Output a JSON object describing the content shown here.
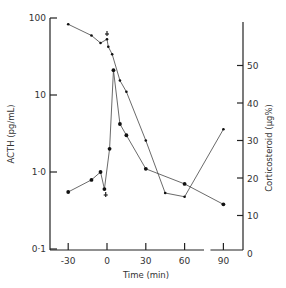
{
  "chart_data": {
    "type": "line",
    "title": "",
    "xlabel": "Time (min)",
    "ylabel": "ACTH (pg/mL)",
    "y2label": "Corticosteroid (µg%)",
    "x_ticks": [
      -30,
      0,
      30,
      60,
      90
    ],
    "x_tick_labels": [
      "-30",
      "0",
      "30",
      "60",
      "90"
    ],
    "y_scale": "log",
    "y_ticks": [
      0.1,
      1.0,
      10,
      100
    ],
    "y_tick_labels": [
      "0·1",
      "1·0",
      "10",
      "100"
    ],
    "y2_ticks": [
      0,
      10,
      20,
      30,
      40,
      50
    ],
    "y2_tick_labels": [
      "0",
      "10",
      "20",
      "30",
      "40",
      "50"
    ],
    "xlim": [
      -45,
      100
    ],
    "ylim": [
      0.1,
      100
    ],
    "y2lim": [
      0,
      61
    ],
    "grid": false,
    "legend": null,
    "axis_break_x": [
      75,
      80
    ],
    "series": [
      {
        "name": "ACTH",
        "axis": "left",
        "marker": "circle",
        "x": [
          -30,
          -12,
          -5,
          -2,
          2,
          5,
          10,
          15,
          30,
          60,
          90
        ],
        "values": [
          0.55,
          0.79,
          1.0,
          0.6,
          2.0,
          21,
          4.2,
          3.0,
          1.1,
          0.7,
          0.38
        ]
      },
      {
        "name": "Corticosteroid",
        "axis": "right",
        "marker": "dot",
        "x": [
          -30,
          -12,
          -5,
          0,
          1,
          4,
          10,
          15,
          30,
          45,
          60,
          90
        ],
        "values": [
          61,
          58,
          56,
          57,
          55,
          53,
          46,
          43,
          30,
          16,
          15,
          33
        ]
      }
    ],
    "annotations": [
      {
        "type": "arrow-marker",
        "x": 0,
        "series": "Corticosteroid",
        "label": "+"
      },
      {
        "type": "arrow-marker",
        "x": 0,
        "series": "ACTH",
        "label": "+"
      }
    ]
  }
}
